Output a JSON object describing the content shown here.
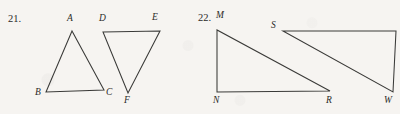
{
  "page": {
    "width": 400,
    "height": 114,
    "background_color": "#f6f4f1",
    "ink_color": "#3a3a38"
  },
  "problems": [
    {
      "number": "21.",
      "number_pos": {
        "x": 8,
        "y": 14
      },
      "figures": [
        {
          "name": "triangle-abc",
          "orientation": "apex-up",
          "vertices": [
            {
              "label": "A",
              "x": 72,
              "y": 31,
              "label_x": 67,
              "label_y": 14
            },
            {
              "label": "B",
              "x": 46,
              "y": 92,
              "label_x": 35,
              "label_y": 88
            },
            {
              "label": "C",
              "x": 104,
              "y": 90,
              "label_x": 106,
              "label_y": 88
            }
          ],
          "path": "M 72 31 L 46 92 L 104 90 Z"
        },
        {
          "name": "triangle-def",
          "orientation": "apex-down",
          "vertices": [
            {
              "label": "D",
              "x": 103,
              "y": 32,
              "label_x": 99,
              "label_y": 14
            },
            {
              "label": "E",
              "x": 160,
              "y": 31,
              "label_x": 152,
              "label_y": 13
            },
            {
              "label": "F",
              "x": 128,
              "y": 93,
              "label_x": 124,
              "label_y": 96
            }
          ],
          "path": "M 103 32 L 160 31 L 128 93 Z"
        }
      ]
    },
    {
      "number": "22.",
      "number_pos": {
        "x": 198,
        "y": 13
      },
      "figures": [
        {
          "name": "triangle-mnr",
          "orientation": "right-angle-left",
          "vertices": [
            {
              "label": "M",
              "x": 217,
              "y": 30,
              "label_x": 216,
              "label_y": 11
            },
            {
              "label": "N",
              "x": 217,
              "y": 92,
              "label_x": 213,
              "label_y": 96
            },
            {
              "label": "R",
              "x": 330,
              "y": 91,
              "label_x": 326,
              "label_y": 96
            }
          ],
          "path": "M 217 30 L 217 92 L 330 91 Z"
        },
        {
          "name": "triangle-sw",
          "orientation": "right-angle-right",
          "vertices": [
            {
              "label": "S",
              "x": 283,
              "y": 31,
              "label_x": 271,
              "label_y": 21
            },
            {
              "label": "",
              "x": 396,
              "y": 31,
              "label_x": 0,
              "label_y": 0
            },
            {
              "label": "W",
              "x": 393,
              "y": 92,
              "label_x": 384,
              "label_y": 96
            }
          ],
          "path": "M 283 31 L 396 31 L 393 92 Z"
        }
      ]
    }
  ]
}
